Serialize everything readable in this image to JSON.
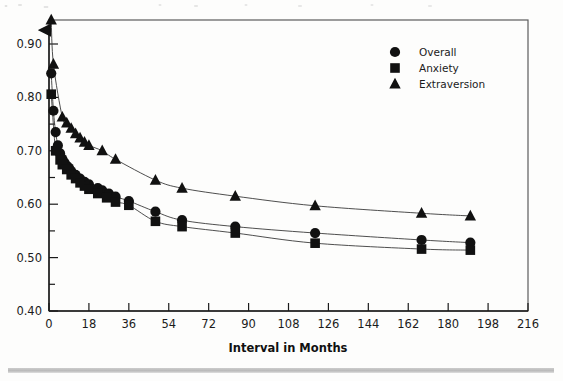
{
  "figure": {
    "kind": "scanned-journal-figure",
    "background_color": "#fdfdfc",
    "frame_color": "#5c5c5c",
    "marker_color": "#111111",
    "curve_color": "#3a3a3a"
  },
  "legend": {
    "position": "top-right-inside",
    "entries": [
      {
        "label": "Overall",
        "marker": "circle"
      },
      {
        "label": "Anxiety",
        "marker": "square"
      },
      {
        "label": "Extraversion",
        "marker": "triangle"
      }
    ]
  },
  "axes": {
    "x_title": "Interval in Months",
    "y_title": "",
    "x_ticks": [
      "0",
      "18",
      "36",
      "54",
      "72",
      "90",
      "108",
      "126",
      "144",
      "162",
      "180",
      "198",
      "216"
    ],
    "y_ticks": [
      "0.40",
      "0.50",
      "0.60",
      "0.70",
      "0.80",
      "0.90"
    ]
  },
  "chart_data": {
    "type": "scatter",
    "title": "",
    "subtitle": "",
    "xlabel": "Interval in Months",
    "ylabel": "",
    "xlim": [
      0,
      216
    ],
    "ylim": [
      0.4,
      0.95
    ],
    "xticks": [
      0,
      18,
      36,
      54,
      72,
      90,
      108,
      126,
      144,
      162,
      180,
      198,
      216
    ],
    "yticks": [
      0.4,
      0.5,
      0.6,
      0.7,
      0.8,
      0.9
    ],
    "yticks_minor": [
      0.45,
      0.55,
      0.65,
      0.75,
      0.85,
      0.95
    ],
    "grid": false,
    "legend_position": "upper right",
    "annotations": [],
    "series": [
      {
        "name": "Overall",
        "marker": "circle",
        "has_fit_curve": true,
        "points": [
          {
            "x": 1,
            "y": 0.845
          },
          {
            "x": 2,
            "y": 0.775
          },
          {
            "x": 3,
            "y": 0.735
          },
          {
            "x": 4,
            "y": 0.71
          },
          {
            "x": 5,
            "y": 0.695
          },
          {
            "x": 6,
            "y": 0.685
          },
          {
            "x": 7,
            "y": 0.678
          },
          {
            "x": 8,
            "y": 0.672
          },
          {
            "x": 9,
            "y": 0.668
          },
          {
            "x": 10,
            "y": 0.662
          },
          {
            "x": 12,
            "y": 0.655
          },
          {
            "x": 14,
            "y": 0.648
          },
          {
            "x": 16,
            "y": 0.642
          },
          {
            "x": 18,
            "y": 0.637
          },
          {
            "x": 22,
            "y": 0.63
          },
          {
            "x": 24,
            "y": 0.626
          },
          {
            "x": 27,
            "y": 0.62
          },
          {
            "x": 30,
            "y": 0.614
          },
          {
            "x": 36,
            "y": 0.606
          },
          {
            "x": 48,
            "y": 0.586
          },
          {
            "x": 60,
            "y": 0.57
          },
          {
            "x": 84,
            "y": 0.558
          },
          {
            "x": 120,
            "y": 0.546
          },
          {
            "x": 168,
            "y": 0.533
          },
          {
            "x": 190,
            "y": 0.528
          }
        ]
      },
      {
        "name": "Anxiety",
        "marker": "square",
        "has_fit_curve": true,
        "points": [
          {
            "x": 1,
            "y": 0.806
          },
          {
            "x": 3,
            "y": 0.7
          },
          {
            "x": 5,
            "y": 0.683
          },
          {
            "x": 6,
            "y": 0.674
          },
          {
            "x": 8,
            "y": 0.665
          },
          {
            "x": 10,
            "y": 0.655
          },
          {
            "x": 12,
            "y": 0.648
          },
          {
            "x": 14,
            "y": 0.64
          },
          {
            "x": 16,
            "y": 0.634
          },
          {
            "x": 18,
            "y": 0.628
          },
          {
            "x": 22,
            "y": 0.62
          },
          {
            "x": 26,
            "y": 0.612
          },
          {
            "x": 30,
            "y": 0.604
          },
          {
            "x": 36,
            "y": 0.598
          },
          {
            "x": 48,
            "y": 0.568
          },
          {
            "x": 60,
            "y": 0.558
          },
          {
            "x": 84,
            "y": 0.546
          },
          {
            "x": 120,
            "y": 0.527
          },
          {
            "x": 168,
            "y": 0.516
          },
          {
            "x": 190,
            "y": 0.514
          }
        ]
      },
      {
        "name": "Extraversion",
        "marker": "triangle",
        "has_fit_curve": true,
        "points": [
          {
            "x": 1,
            "y": 0.945
          },
          {
            "x": 2,
            "y": 0.862
          },
          {
            "x": 6,
            "y": 0.763
          },
          {
            "x": 8,
            "y": 0.752
          },
          {
            "x": 10,
            "y": 0.742
          },
          {
            "x": 12,
            "y": 0.732
          },
          {
            "x": 14,
            "y": 0.724
          },
          {
            "x": 16,
            "y": 0.716
          },
          {
            "x": 18,
            "y": 0.71
          },
          {
            "x": 24,
            "y": 0.7
          },
          {
            "x": 30,
            "y": 0.684
          },
          {
            "x": 48,
            "y": 0.645
          },
          {
            "x": 60,
            "y": 0.63
          },
          {
            "x": 84,
            "y": 0.615
          },
          {
            "x": 120,
            "y": 0.597
          },
          {
            "x": 168,
            "y": 0.583
          },
          {
            "x": 190,
            "y": 0.578
          }
        ]
      }
    ]
  }
}
